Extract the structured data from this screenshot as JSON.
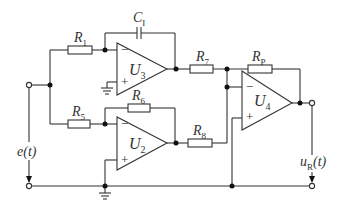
{
  "diagram": {
    "type": "circuit-schematic",
    "components": {
      "resistors": {
        "R1": {
          "name": "R",
          "sub": "1"
        },
        "R5": {
          "name": "R",
          "sub": "5"
        },
        "R6": {
          "name": "R",
          "sub": "6"
        },
        "R7": {
          "name": "R",
          "sub": "7"
        },
        "R8": {
          "name": "R",
          "sub": "8"
        },
        "RP": {
          "name": "R",
          "sub": "P"
        }
      },
      "capacitors": {
        "C1": {
          "name": "C",
          "sub": "I"
        }
      },
      "opamps": {
        "U3": {
          "name": "U",
          "sub": "3"
        },
        "U2": {
          "name": "U",
          "sub": "2"
        },
        "U4": {
          "name": "U",
          "sub": "4"
        }
      }
    },
    "signals": {
      "input": {
        "name": "e",
        "arg": "(t)"
      },
      "output": {
        "name": "u",
        "sub": "R",
        "arg": "(t)"
      }
    },
    "signs": {
      "minus": "−",
      "plus": "+"
    },
    "colors": {
      "line": "#333333",
      "node": "#111111",
      "background": "#ffffff"
    }
  }
}
